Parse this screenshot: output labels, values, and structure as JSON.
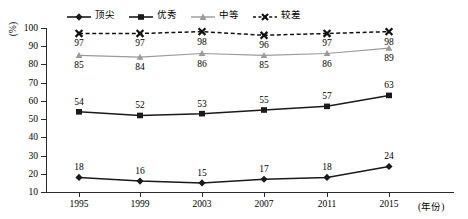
{
  "chart_data": {
    "type": "line",
    "title": "",
    "xlabel": "(年份)",
    "ylabel": "(%)",
    "categories": [
      "1995",
      "1999",
      "2003",
      "2007",
      "2011",
      "2015"
    ],
    "ylim": [
      10,
      100
    ],
    "ytick_labels": [
      "100",
      "90",
      "80",
      "70",
      "60",
      "50",
      "40",
      "30",
      "20",
      "10"
    ],
    "yticks": [
      100,
      90,
      80,
      70,
      60,
      50,
      40,
      30,
      20,
      10
    ],
    "grid": false,
    "legend_position": "top",
    "series": [
      {
        "name": "顶尖",
        "marker": "diamond",
        "line": "solid",
        "color": "#1a1a1a",
        "values": [
          18,
          16,
          15,
          17,
          18,
          24
        ],
        "labels": [
          "18",
          "16",
          "15",
          "17",
          "18",
          "24"
        ]
      },
      {
        "name": "优秀",
        "marker": "square",
        "line": "solid",
        "color": "#1a1a1a",
        "values": [
          54,
          52,
          53,
          55,
          57,
          63
        ],
        "labels": [
          "54",
          "52",
          "53",
          "55",
          "57",
          "63"
        ]
      },
      {
        "name": "中等",
        "marker": "triangle",
        "line": "solid",
        "color": "#9a9a9a",
        "values": [
          85,
          84,
          86,
          85,
          86,
          89
        ],
        "labels": [
          "85",
          "84",
          "86",
          "85",
          "86",
          "89"
        ]
      },
      {
        "name": "较差",
        "marker": "x",
        "line": "dashed",
        "color": "#111111",
        "values": [
          97,
          97,
          98,
          96,
          97,
          98
        ],
        "labels": [
          "97",
          "97",
          "98",
          "96",
          "97",
          "98"
        ]
      }
    ]
  }
}
